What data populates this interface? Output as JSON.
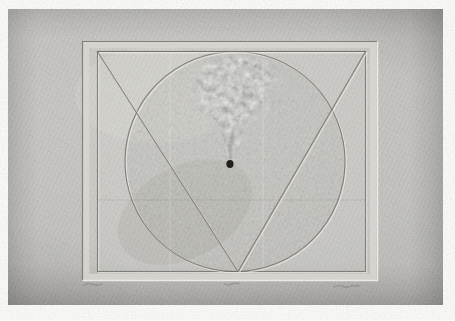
{
  "meta": {
    "medium": "embossed paper relief, photographed"
  },
  "palette": {
    "page_white": "#fcfcfb",
    "paper_light": "#cccbc8",
    "paper_mid": "#c3c2bf",
    "paper_dark": "#a9a8a5",
    "emboss_highlight": "#edebe6",
    "emboss_shadow": "#6f6d67",
    "hole_black": "#241f19",
    "pencil_gray": "#84827c"
  },
  "artwork": {
    "elements": [
      "textured-paper-ground",
      "embossed-plate-frame",
      "incised-inner-rectangle",
      "embossed-circle",
      "embossed-v-triangle",
      "granular-relief-patch",
      "pierced-black-hole",
      "paper-creases",
      "pencil-inscriptions"
    ],
    "inscriptions_note": "three faint illegible pencil marks under the lower plate edge (left, center, right)",
    "geometry": {
      "photo": {
        "x": 8,
        "y": 9,
        "width": 435,
        "height": 296
      },
      "grain_full": {
        "x": 8,
        "y": 9,
        "width": 435,
        "height": 296
      },
      "plate_field": {
        "x": 82,
        "y": 41,
        "width": 296,
        "height": 240
      },
      "plate_outline_dark": {
        "points": "377,41.5 82.5,41.5 82.5,280.5"
      },
      "plate_outline_light": {
        "points": "82.5,280.5 377.5,280.5 377.5,41.5"
      },
      "plate_band": {
        "x": 86,
        "y": 45,
        "width": 287,
        "height": 232
      },
      "inner_rect_dark": {
        "x": 97.5,
        "y": 51.5,
        "width": 268,
        "height": 220
      },
      "inner_rect_light": {
        "x": 98.7,
        "y": 52.7,
        "width": 268,
        "height": 220
      },
      "circle_fill": {
        "cx": 235,
        "cy": 161.5,
        "r": 109
      },
      "circle_dark": {
        "cx": 235,
        "cy": 161.5,
        "r": 110
      },
      "circle_light": {
        "cx": 236.3,
        "cy": 162.8,
        "r": 110
      },
      "triangle_dark": {
        "points": "97.5,51.5 365.5,51.5 238,271.5"
      },
      "triangle_light": {
        "points": "98.8,52.8 366.8,52.8 239.3,272.8"
      },
      "grain_circle_rect": {
        "x": 120,
        "y": 50,
        "width": 230,
        "height": 224
      },
      "grain_patch_rect": {
        "x": 190,
        "y": 50,
        "width": 95,
        "height": 125
      },
      "texture_teardrop": {
        "d": "M235,56 C206,58 195,72 198,90 C201,106 215,114 221,132 C227,150 227,159 231,169 C236,159 239,146 245,128 C253,108 269,100 271,84 C273,67 261,57 235,56 Z"
      },
      "texture_halo": {
        "cx": 237,
        "cy": 88,
        "rx": 48,
        "ry": 36
      },
      "light_patch": {
        "cx": 155,
        "cy": 95,
        "rx": 80,
        "ry": 48
      },
      "dark_patch": {
        "cx": 185,
        "cy": 212,
        "rx": 72,
        "ry": 46
      },
      "crease_v1": {
        "x1": 170,
        "y1": 53,
        "x2": 170,
        "y2": 271
      },
      "crease_v2": {
        "x1": 263,
        "y1": 53,
        "x2": 263,
        "y2": 271
      },
      "crease_h1": {
        "x1": 98,
        "y1": 200,
        "x2": 365,
        "y2": 200
      },
      "hole": {
        "cx": 230,
        "cy": 164,
        "rx": 3.6,
        "ry": 4.1
      },
      "hole_trail": {
        "d": "M233,130 C231,140 230,150 230.5,158"
      },
      "inscription_left": {
        "d": "M84,285 q5,-2.5 10,-0.5 q4,2 8,-1"
      },
      "inscription_center": {
        "d": "M224,283.5 q4,2.5 8,0.5 q3,-2 7,0"
      },
      "inscription_right": {
        "d": "M334,287 q5,-2.5 9,-0.5 q5,2 9,-1 q3,1 7,0"
      }
    }
  }
}
